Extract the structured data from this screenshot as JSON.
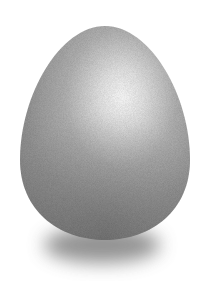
{
  "image": {
    "subject": "egg",
    "description": "Stippled grayscale illustration of a single egg standing upright with a soft shadow beneath it on a white background",
    "background_color": "#ffffff",
    "egg": {
      "center_x": 105,
      "center_y": 135,
      "width": 170,
      "height": 214,
      "highlight_center": [
        118,
        100
      ],
      "base_color": "#8f8f8f",
      "highlight_color": "#fbfbfb",
      "edge_color": "#7a7a7a"
    },
    "shadow": {
      "center_x": 102,
      "center_y": 243,
      "width": 120,
      "height": 36,
      "color": "#6e6e6e"
    }
  }
}
